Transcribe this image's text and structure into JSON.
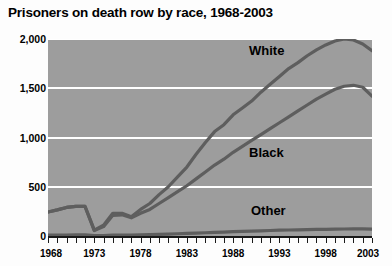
{
  "chart_data": {
    "type": "line",
    "title": "Prisoners on death row by race, 1968-2003",
    "xlabel": "",
    "ylabel": "",
    "xlim": [
      1968,
      2003
    ],
    "ylim": [
      0,
      2000
    ],
    "grid": true,
    "legend_position": "inline-annotations",
    "y_ticks": [
      0,
      500,
      1000,
      1500,
      2000
    ],
    "y_tick_labels": [
      "0",
      "500",
      "1,000",
      "1,500",
      "2,000"
    ],
    "x_ticks": [
      1968,
      1973,
      1978,
      1983,
      1988,
      1993,
      1998,
      2003
    ],
    "x_tick_labels": [
      "1968",
      "1973",
      "1978",
      "1983",
      "1988",
      "1993",
      "1998",
      "2003"
    ],
    "x": [
      1968,
      1969,
      1970,
      1971,
      1972,
      1973,
      1974,
      1975,
      1976,
      1977,
      1978,
      1979,
      1980,
      1981,
      1982,
      1983,
      1984,
      1985,
      1986,
      1987,
      1988,
      1989,
      1990,
      1991,
      1992,
      1993,
      1994,
      1995,
      1996,
      1997,
      1998,
      1999,
      2000,
      2001,
      2002,
      2003
    ],
    "series": [
      {
        "name": "White",
        "label": "White",
        "color": "#5e5e5e",
        "values": [
          243,
          265,
          290,
          300,
          300,
          60,
          110,
          230,
          230,
          195,
          270,
          330,
          420,
          500,
          600,
          700,
          830,
          950,
          1060,
          1130,
          1230,
          1300,
          1370,
          1460,
          1540,
          1620,
          1700,
          1760,
          1830,
          1890,
          1940,
          1980,
          2000,
          1990,
          1950,
          1880
        ]
      },
      {
        "name": "Black",
        "label": "Black",
        "color": "#5e5e5e",
        "values": [
          243,
          265,
          290,
          300,
          300,
          55,
          95,
          210,
          215,
          185,
          230,
          270,
          330,
          390,
          450,
          510,
          580,
          650,
          720,
          780,
          850,
          910,
          970,
          1030,
          1090,
          1150,
          1210,
          1270,
          1330,
          1390,
          1440,
          1490,
          1520,
          1530,
          1510,
          1420
        ]
      },
      {
        "name": "Other",
        "label": "Other",
        "color": "#5e5e5e",
        "values": [
          8,
          9,
          10,
          11,
          11,
          3,
          5,
          9,
          10,
          10,
          12,
          14,
          17,
          20,
          23,
          26,
          30,
          33,
          37,
          40,
          44,
          47,
          50,
          53,
          56,
          59,
          61,
          63,
          65,
          67,
          68,
          70,
          71,
          72,
          72,
          70
        ]
      }
    ]
  }
}
